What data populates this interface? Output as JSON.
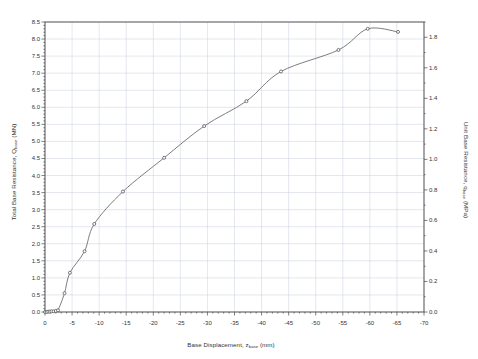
{
  "chart_data": {
    "type": "line",
    "title": "",
    "xlabel": "Base Displacement, z",
    "xlabel_sub": "base",
    "xlabel_unit": " (mm)",
    "ylabel_left": "Total Base Resistance, Q",
    "ylabel_left_sub": "base",
    "ylabel_left_unit": " (MN)",
    "ylabel_right": "Unit Base Resistance, q",
    "ylabel_right_sub": "base",
    "ylabel_right_unit": " (MPa)",
    "xlim": [
      0,
      -70
    ],
    "ylim_left": [
      0.0,
      8.5
    ],
    "ylim_right": [
      0.0,
      1.9
    ],
    "xticks": [
      0,
      -5,
      -10,
      -15,
      -20,
      -25,
      -30,
      -35,
      -40,
      -45,
      -50,
      -55,
      -60,
      -65,
      -70
    ],
    "xticklabels": [
      "0",
      "-5",
      "-10",
      "-15",
      "-20",
      "-25",
      "-30",
      "-35",
      "-40",
      "-45",
      "-50",
      "-55",
      "-60",
      "-65",
      "-70"
    ],
    "yticks_left": [
      0.0,
      0.5,
      1.0,
      1.5,
      2.0,
      2.5,
      3.0,
      3.5,
      4.0,
      4.5,
      5.0,
      5.5,
      6.0,
      6.5,
      7.0,
      7.5,
      8.0,
      8.5
    ],
    "yticklabels_left": [
      "0.0",
      "0.5",
      "1.0",
      "1.5",
      "2.0",
      "2.5",
      "3.0",
      "3.5",
      "4.0",
      "4.5",
      "5.0",
      "5.5",
      "6.0",
      "6.5",
      "7.0",
      "7.5",
      "8.0",
      "8.5"
    ],
    "yticks_right": [
      0.0,
      0.2,
      0.4,
      0.6,
      0.8,
      1.0,
      1.2,
      1.4,
      1.6,
      1.8
    ],
    "yticklabels_right": [
      "0.0",
      "0.2",
      "0.4",
      "0.6",
      "0.8",
      "1.0",
      "1.2",
      "1.4",
      "1.6",
      "1.8"
    ],
    "grid": true,
    "legend": null,
    "series": [
      {
        "name": "Base load-displacement response",
        "marker": "circle",
        "line_color": "#6e6e72",
        "marker_color": "#58585c",
        "x": [
          0.0,
          -0.3,
          -0.6,
          -0.9,
          -1.2,
          -1.6,
          -2.0,
          -2.4,
          -3.6,
          -4.6,
          -7.3,
          -9.1,
          -14.4,
          -22.0,
          -29.4,
          -37.2,
          -43.6,
          -54.2,
          -59.6,
          -65.2
        ],
        "y": [
          0.0,
          0.0,
          0.01,
          0.01,
          0.02,
          0.02,
          0.03,
          0.05,
          0.55,
          1.15,
          1.78,
          2.58,
          3.53,
          4.52,
          5.45,
          6.18,
          7.05,
          7.68,
          8.3,
          8.21
        ],
        "y_right": [
          0.0,
          0.0,
          0.002,
          0.002,
          0.004,
          0.004,
          0.007,
          0.011,
          0.123,
          0.257,
          0.398,
          0.577,
          0.789,
          1.01,
          1.218,
          1.381,
          1.576,
          1.717,
          1.855,
          1.835
        ]
      }
    ]
  },
  "plot_box": {
    "left": 45,
    "right": 424,
    "top": 22,
    "bottom": 312
  },
  "style": {
    "frame_color": "#4a4a4a",
    "grid_color": "#c8cfdd",
    "background": "#ffffff",
    "text_color": "#333333"
  }
}
